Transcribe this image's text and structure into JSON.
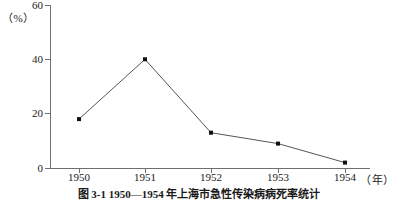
{
  "chart_data": {
    "type": "line",
    "title": "",
    "caption": "图 3-1  1950—1954 年上海市急性传染病病死率统计",
    "categories": [
      "1950",
      "1951",
      "1952",
      "1953",
      "1954"
    ],
    "values": [
      18,
      40,
      13,
      9,
      2
    ],
    "xlabel": "（年）",
    "ylabel": "（%）",
    "ylim": [
      0,
      60
    ],
    "yticks": [
      "0",
      "20",
      "40",
      "60"
    ],
    "ytick_values": [
      0,
      20,
      40,
      60
    ],
    "grid": false,
    "legend": "none",
    "series_color": "#555555",
    "marker": "square",
    "marker_color": "#111111",
    "axis_color": "#6f6f6f"
  }
}
